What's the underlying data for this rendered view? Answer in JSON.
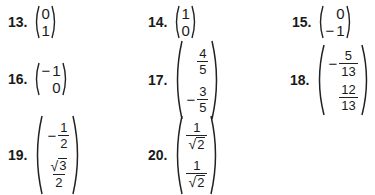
{
  "problems": [
    {
      "number": "13.",
      "entries": [
        {
          "sign": "",
          "value": "0"
        },
        {
          "sign": "",
          "value": "1"
        }
      ]
    },
    {
      "number": "14.",
      "entries": [
        {
          "sign": "",
          "value": "1"
        },
        {
          "sign": "",
          "value": "0"
        }
      ]
    },
    {
      "number": "15.",
      "entries": [
        {
          "sign": "",
          "value": "0"
        },
        {
          "sign": "−",
          "value": "1"
        }
      ]
    },
    {
      "number": "16.",
      "entries": [
        {
          "sign": "−",
          "value": "1"
        },
        {
          "sign": "",
          "value": "0"
        }
      ]
    },
    {
      "number": "17.",
      "entries": [
        {
          "sign": "",
          "numerator": "4",
          "denominator": "5"
        },
        {
          "sign": "−",
          "numerator": "3",
          "denominator": "5"
        }
      ]
    },
    {
      "number": "18.",
      "entries": [
        {
          "sign": "−",
          "numerator": "5",
          "denominator": "13"
        },
        {
          "sign": "",
          "numerator": "12",
          "denominator": "13"
        }
      ]
    },
    {
      "number": "19.",
      "entries": [
        {
          "sign": "−",
          "numerator": "1",
          "denominator": "2"
        },
        {
          "sign": "",
          "numerator": "√3",
          "numerator_radicand": "3",
          "denominator": "2"
        }
      ]
    },
    {
      "number": "20.",
      "entries": [
        {
          "sign": "",
          "numerator": "1",
          "denominator": "√2",
          "denominator_radicand": "2"
        },
        {
          "sign": "",
          "numerator": "1",
          "denominator": "√2",
          "denominator_radicand": "2"
        }
      ]
    }
  ],
  "symbols": {
    "radical": "√"
  }
}
